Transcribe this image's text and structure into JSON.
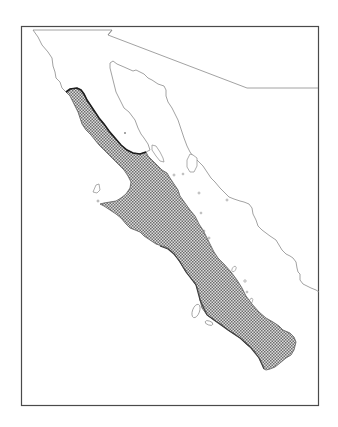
{
  "map": {
    "type": "species-distribution-map",
    "region_depicted": "Baja California peninsula and Sonora coast",
    "frame": {
      "x": 21,
      "y": 26,
      "width": 298,
      "height": 380
    },
    "colors": {
      "background": "#ffffff",
      "frame": "#4a4a4a",
      "coastline": "#8a8a8a",
      "range_fill_light": "#d8d8d8",
      "range_fill_dark": "#6a6a6a",
      "range_edge": "#2a2a2a"
    },
    "features": [
      {
        "name": "international-border",
        "kind": "line"
      },
      {
        "name": "peninsula-coastline",
        "kind": "line"
      },
      {
        "name": "mainland-coastline",
        "kind": "line"
      },
      {
        "name": "gulf-islands",
        "kind": "polygons"
      },
      {
        "name": "pacific-islands",
        "kind": "polygons"
      },
      {
        "name": "species-range",
        "kind": "stippled-area"
      }
    ],
    "labels": []
  }
}
